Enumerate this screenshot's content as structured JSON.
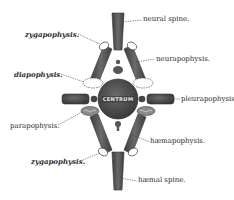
{
  "figure": {
    "centrum_label": "CENTRUM",
    "colors": {
      "bone_dark": "#4a4a4a",
      "bone_mid": "#6e6e6e",
      "background": "#ffffff",
      "text": "#2a2a2a"
    }
  },
  "labels": {
    "neural_spine": "neural spine.",
    "zygapophysis_upper": "zygapophysis.",
    "neurapophysis": "neurapophysis.",
    "diapophysis": "diapophysis.",
    "pleurapophysis": "pleurapophysis.",
    "parapophysis": "parapophysis.",
    "haemapophysis": "hæmapophysis.",
    "zygapophysis_lower": "zygapophysis.",
    "haemal_spine": "hæmal spine."
  }
}
